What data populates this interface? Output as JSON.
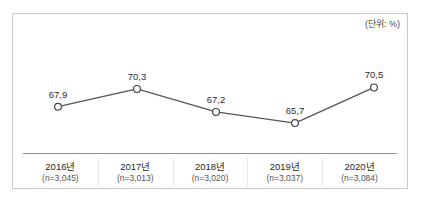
{
  "top_caption": "",
  "chart": {
    "unit_label": "(단위: %)"
  },
  "chart_data": {
    "type": "line",
    "title": "",
    "subtitle": "",
    "xlabel": "",
    "ylabel": "",
    "unit": "(단위: %)",
    "grid": false,
    "legend": "none",
    "categories": [
      "2016년",
      "2017년",
      "2018년",
      "2019년",
      "2020년"
    ],
    "category_sublabels": [
      "(n=3,045)",
      "(n=3,013)",
      "(n=3,020)",
      "(n=3,037)",
      "(n=3,084)"
    ],
    "sample_sizes": [
      3045,
      3013,
      3020,
      3037,
      3084
    ],
    "values": [
      67.9,
      70.3,
      67.2,
      65.7,
      70.5
    ],
    "value_labels": [
      "67,9",
      "70,3",
      "67,2",
      "65,7",
      "70,5"
    ],
    "ylim": [
      64.5,
      71.5
    ],
    "series": [
      {
        "name": "",
        "values": [
          67.9,
          70.3,
          67.2,
          65.7,
          70.5
        ],
        "line_color": "#555555",
        "marker_fill": "#ffffff",
        "marker_stroke": "#444444"
      }
    ]
  }
}
